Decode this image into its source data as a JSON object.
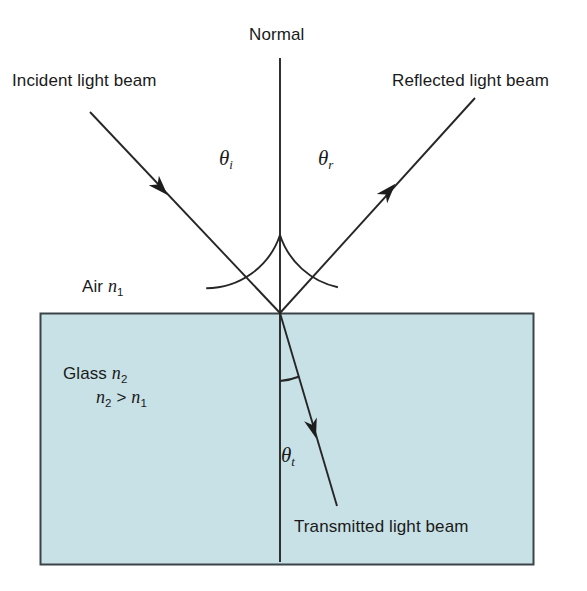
{
  "figure": {
    "type": "physics-optics-diagram",
    "title_text": "Normal"
  },
  "labels": {
    "normal": "Normal",
    "incident_beam": "Incident light beam",
    "reflected_beam": "Reflected light beam",
    "transmitted_beam": "Transmitted light beam",
    "air_medium": "Air",
    "air_index": "n",
    "air_index_sub": "1",
    "glass_medium": "Glass",
    "glass_index": "n",
    "glass_index_sub": "2",
    "inequality_left": "n",
    "inequality_left_sub": "2",
    "inequality_op": ">",
    "inequality_right": "n",
    "inequality_right_sub": "1",
    "angle_incidence": "θ",
    "angle_incidence_sub": "i",
    "angle_reflection": "θ",
    "angle_reflection_sub": "r",
    "angle_transmission": "θ",
    "angle_transmission_sub": "t"
  },
  "colors": {
    "glass_fill": "#c8e1e6",
    "glass_stroke": "#3a4448",
    "line": "#262626",
    "text": "#1a1a1a",
    "background": "#ffffff"
  },
  "geometry": {
    "canvas_width": 587,
    "canvas_height": 591,
    "interface_point": {
      "x": 280,
      "y": 313
    },
    "glass_rect": {
      "x": 40,
      "y": 313,
      "width": 493,
      "height": 251
    },
    "normal_line": {
      "x": 280,
      "y_top": 58,
      "y_bottom": 562
    },
    "incident_ray": {
      "x1": 90,
      "y1": 112,
      "x2": 280,
      "y2": 313
    },
    "incident_arrow": {
      "x": 160,
      "y": 187
    },
    "reflected_ray": {
      "x1": 280,
      "y1": 313,
      "x2": 475,
      "y2": 98
    },
    "reflected_arrow": {
      "x": 388,
      "y": 192
    },
    "transmitted_ray": {
      "x1": 280,
      "y1": 313,
      "x2": 337,
      "y2": 506
    },
    "transmitted_arrow": {
      "x": 313,
      "y": 428
    },
    "arc_incidence": {
      "radius": 78
    },
    "arc_reflection": {
      "radius": 78
    },
    "arc_transmission": {
      "radius": 68
    }
  }
}
